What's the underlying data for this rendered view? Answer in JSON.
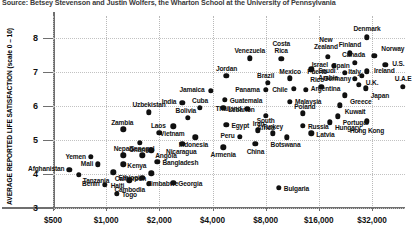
{
  "source_note": "Source: Betsey Stevenson and Justin Wolfers, the Wharton School at the University of Pennsylvania",
  "chart_data": {
    "type": "scatter",
    "title": "",
    "xlabel": "",
    "ylabel": "AVERAGE REPORTED LIFE SATISFACTION (scale 0 – 10)",
    "x_scale": "log",
    "xticks": [
      "$500",
      "$1,000",
      "$2,000",
      "$4,000",
      "$8,000",
      "$16,000",
      "$32,000"
    ],
    "xtick_values": [
      500,
      1000,
      2000,
      4000,
      8000,
      16000,
      32000
    ],
    "yticks": [
      "3",
      "4",
      "5",
      "6",
      "7",
      "8"
    ],
    "ytick_values": [
      3,
      4,
      5,
      6,
      7,
      8
    ],
    "ylim": [
      2.6,
      8.5
    ],
    "grid": true,
    "legend": "none",
    "points": [
      {
        "name": "Denmark",
        "x": 30000,
        "y": 8.02,
        "lx": 0,
        "ly": -9,
        "la": "c"
      },
      {
        "name": "New Zealand",
        "x": 18000,
        "y": 7.45,
        "lx": -2,
        "ly": -17,
        "la": "c",
        "multiline": true
      },
      {
        "name": "Finland",
        "x": 24000,
        "y": 7.55,
        "lx": 0,
        "ly": -9,
        "la": "c"
      },
      {
        "name": "Norway",
        "x": 33000,
        "y": 7.48,
        "lx": 7,
        "ly": -7,
        "la": "l"
      },
      {
        "name": "Canada",
        "x": 25500,
        "y": 7.27,
        "lx": -1,
        "ly": -8,
        "la": "c"
      },
      {
        "name": "U.S.",
        "x": 38000,
        "y": 7.22,
        "lx": 7,
        "ly": -1,
        "la": "l"
      },
      {
        "name": "Israel",
        "x": 19500,
        "y": 7.18,
        "lx": -6,
        "ly": -1,
        "la": "r"
      },
      {
        "name": "Ireland",
        "x": 30000,
        "y": 7.02,
        "lx": 7,
        "ly": -1,
        "la": "l"
      },
      {
        "name": "Spain",
        "x": 22500,
        "y": 6.98,
        "lx": -4,
        "ly": -7,
        "la": "c"
      },
      {
        "name": "U.K.",
        "x": 28000,
        "y": 6.88,
        "lx": 4,
        "ly": 6,
        "la": "l"
      },
      {
        "name": "Italy",
        "x": 25500,
        "y": 6.8,
        "lx": 0,
        "ly": -7,
        "la": "c"
      },
      {
        "name": "Germany",
        "x": 27000,
        "y": 6.62,
        "lx": -8,
        "ly": -6,
        "la": "r"
      },
      {
        "name": "Japan",
        "x": 29500,
        "y": 6.52,
        "lx": 5,
        "ly": 7,
        "la": "l"
      },
      {
        "name": "Greece",
        "x": 22500,
        "y": 6.32,
        "lx": 5,
        "ly": 6,
        "la": "l"
      },
      {
        "name": "Puerto Rico",
        "x": 16500,
        "y": 6.56,
        "lx": -4,
        "ly": -15,
        "la": "c",
        "multiline": true
      },
      {
        "name": "Kuwait",
        "x": 21000,
        "y": 6.02,
        "lx": 5,
        "ly": 6,
        "la": "l"
      },
      {
        "name": "U.A.E",
        "x": 48000,
        "y": 6.56,
        "lx": 0,
        "ly": -8,
        "la": "c"
      },
      {
        "name": "Hong Kong",
        "x": 30000,
        "y": 5.55,
        "lx": 0,
        "ly": 9,
        "la": "c"
      },
      {
        "name": "Portugal",
        "x": 20500,
        "y": 5.7,
        "lx": 5,
        "ly": 6,
        "la": "l"
      },
      {
        "name": "Hungary",
        "x": 18500,
        "y": 5.52,
        "lx": 5,
        "ly": 5,
        "la": "l"
      },
      {
        "name": "Venezuela",
        "x": 6500,
        "y": 7.4,
        "lx": 0,
        "ly": -8,
        "la": "c"
      },
      {
        "name": "Costa Rica",
        "x": 9800,
        "y": 7.38,
        "lx": 0,
        "ly": -16,
        "la": "c",
        "multiline": true
      },
      {
        "name": "Saudi Arabia",
        "x": 14500,
        "y": 7.08,
        "lx": 7,
        "ly": 1,
        "la": "l",
        "multiline": true
      },
      {
        "name": "Mexico",
        "x": 11000,
        "y": 6.82,
        "lx": 0,
        "ly": -7,
        "la": "c"
      },
      {
        "name": "Brazil",
        "x": 8200,
        "y": 6.68,
        "lx": -2,
        "ly": -7,
        "la": "c"
      },
      {
        "name": "Chile",
        "x": 11500,
        "y": 6.5,
        "lx": -6,
        "ly": 0,
        "la": "r"
      },
      {
        "name": "Argentina",
        "x": 13500,
        "y": 6.48,
        "lx": 5,
        "ly": -1,
        "la": "l"
      },
      {
        "name": "Panama",
        "x": 8000,
        "y": 6.48,
        "lx": -6,
        "ly": 0,
        "la": "r"
      },
      {
        "name": "Jordan",
        "x": 4800,
        "y": 6.88,
        "lx": 0,
        "ly": -8,
        "la": "c"
      },
      {
        "name": "Jamaica",
        "x": 3900,
        "y": 6.45,
        "lx": -6,
        "ly": -1,
        "la": "r"
      },
      {
        "name": "Guatemala",
        "x": 4700,
        "y": 6.18,
        "lx": 5,
        "ly": 1,
        "la": "l"
      },
      {
        "name": "India",
        "x": 2700,
        "y": 6.1,
        "lx": -6,
        "ly": -1,
        "la": "r"
      },
      {
        "name": "Cuba",
        "x": 3400,
        "y": 5.95,
        "lx": 0,
        "ly": -7,
        "la": "c"
      },
      {
        "name": "Lebanon",
        "x": 4600,
        "y": 5.95,
        "lx": 5,
        "ly": 2,
        "la": "l"
      },
      {
        "name": "Malaysia",
        "x": 11000,
        "y": 6.12,
        "lx": 5,
        "ly": 0,
        "la": "l"
      },
      {
        "name": "Thailand",
        "x": 6300,
        "y": 5.92,
        "lx": -6,
        "ly": 0,
        "la": "r"
      },
      {
        "name": "South Africa",
        "x": 8000,
        "y": 5.72,
        "lx": 0,
        "ly": 5,
        "la": "c",
        "multiline": true
      },
      {
        "name": "Poland",
        "x": 13000,
        "y": 5.78,
        "lx": 2,
        "ly": -7,
        "la": "c"
      },
      {
        "name": "Uzbekistan",
        "x": 1750,
        "y": 5.82,
        "lx": 0,
        "ly": -8,
        "la": "c"
      },
      {
        "name": "Bolivia",
        "x": 2900,
        "y": 5.65,
        "lx": -2,
        "ly": -7,
        "la": "c"
      },
      {
        "name": "Vietnam",
        "x": 2400,
        "y": 5.4,
        "lx": -1,
        "ly": 7,
        "la": "c"
      },
      {
        "name": "Egypt",
        "x": 4800,
        "y": 5.45,
        "lx": 5,
        "ly": 1,
        "la": "l"
      },
      {
        "name": "Zambia",
        "x": 1250,
        "y": 5.32,
        "lx": -1,
        "ly": -7,
        "la": "c"
      },
      {
        "name": "Laos",
        "x": 2000,
        "y": 5.22,
        "lx": -1,
        "ly": -7,
        "la": "c"
      },
      {
        "name": "Russia",
        "x": 13000,
        "y": 5.42,
        "lx": 5,
        "ly": 1,
        "la": "l"
      },
      {
        "name": "Latvia",
        "x": 14500,
        "y": 5.2,
        "lx": 5,
        "ly": 1,
        "la": "l"
      },
      {
        "name": "Botswana",
        "x": 10500,
        "y": 5.08,
        "lx": -1,
        "ly": 7,
        "la": "c"
      },
      {
        "name": "Turkey",
        "x": 8800,
        "y": 5.2,
        "lx": 0,
        "ly": -7,
        "la": "c"
      },
      {
        "name": "Iran",
        "x": 7200,
        "y": 5.28,
        "lx": 1,
        "ly": -7,
        "la": "c"
      },
      {
        "name": "Peru",
        "x": 5700,
        "y": 5.1,
        "lx": -5,
        "ly": -1,
        "la": "r"
      },
      {
        "name": "China",
        "x": 7000,
        "y": 4.88,
        "lx": 0,
        "ly": 7,
        "la": "c"
      },
      {
        "name": "Indonesia",
        "x": 3200,
        "y": 5.08,
        "lx": -2,
        "ly": 7,
        "la": "c"
      },
      {
        "name": "Nicaragua",
        "x": 2700,
        "y": 4.88,
        "lx": -1,
        "ly": 7,
        "la": "c"
      },
      {
        "name": "Armenia",
        "x": 4600,
        "y": 4.78,
        "lx": 0,
        "ly": 7,
        "la": "c"
      },
      {
        "name": "Ghana",
        "x": 1550,
        "y": 4.92,
        "lx": -1,
        "ly": 7,
        "la": "c"
      },
      {
        "name": "Angola",
        "x": 1800,
        "y": 4.7,
        "lx": 4,
        "ly": 5,
        "la": "l"
      },
      {
        "name": "Senegal",
        "x": 1600,
        "y": 4.55,
        "lx": 0,
        "ly": -7,
        "la": "c"
      },
      {
        "name": "Nepal",
        "x": 1250,
        "y": 4.55,
        "lx": -1,
        "ly": -7,
        "la": "c"
      },
      {
        "name": "Yemen",
        "x": 820,
        "y": 4.5,
        "lx": -5,
        "ly": -1,
        "la": "r"
      },
      {
        "name": "Kenya",
        "x": 1250,
        "y": 4.28,
        "lx": 4,
        "ly": 1,
        "la": "l"
      },
      {
        "name": "Bangladesh",
        "x": 1950,
        "y": 4.35,
        "lx": 5,
        "ly": 0,
        "la": "l"
      },
      {
        "name": "Mali",
        "x": 900,
        "y": 4.28,
        "lx": -5,
        "ly": -1,
        "la": "r"
      },
      {
        "name": "Afghanistan",
        "x": 620,
        "y": 4.12,
        "lx": -5,
        "ly": -1,
        "la": "r"
      },
      {
        "name": "Tanzania",
        "x": 700,
        "y": 3.98,
        "lx": 4,
        "ly": 6,
        "la": "l"
      },
      {
        "name": "Ethiopia",
        "x": 1100,
        "y": 4.05,
        "lx": 5,
        "ly": 5,
        "la": "l"
      },
      {
        "name": "Haiti",
        "x": 1350,
        "y": 3.82,
        "lx": -5,
        "ly": 5,
        "la": "r"
      },
      {
        "name": "Zimbabwe",
        "x": 1600,
        "y": 3.88,
        "lx": 5,
        "ly": 5,
        "la": "l"
      },
      {
        "name": "Cameroon",
        "x": 1800,
        "y": 4.02,
        "lx": -5,
        "ly": 5,
        "la": "r"
      },
      {
        "name": "Cambodia",
        "x": 1750,
        "y": 3.72,
        "lx": -4,
        "ly": 6,
        "la": "r"
      },
      {
        "name": "Georgia",
        "x": 2400,
        "y": 3.75,
        "lx": 5,
        "ly": 1,
        "la": "l"
      },
      {
        "name": "Benin",
        "x": 980,
        "y": 3.68,
        "lx": -5,
        "ly": -1,
        "la": "r"
      },
      {
        "name": "Togo",
        "x": 1150,
        "y": 3.42,
        "lx": 5,
        "ly": 1,
        "la": "l"
      },
      {
        "name": "Bulgaria",
        "x": 9500,
        "y": 3.6,
        "lx": 5,
        "ly": 1,
        "la": "l"
      }
    ]
  }
}
